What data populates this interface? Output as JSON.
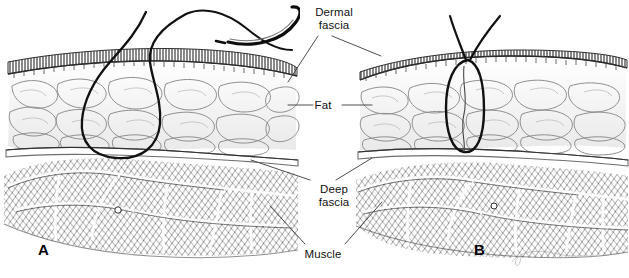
{
  "figure": {
    "type": "medical-illustration",
    "background_color": "#ffffff",
    "ink_color": "#111111",
    "width": 629,
    "height": 278
  },
  "labels": [
    {
      "id": "dermal-fascia",
      "line1": "Dermal",
      "line2": "fascia",
      "x": 303,
      "y": 6
    },
    {
      "id": "fat",
      "line1": "Fat",
      "line2": "",
      "x": 322,
      "y": 100
    },
    {
      "id": "deep-fascia",
      "line1": "Deep",
      "line2": "fascia",
      "x": 303,
      "y": 183
    },
    {
      "id": "muscle",
      "line1": "Muscle",
      "line2": "",
      "x": 302,
      "y": 248
    }
  ],
  "panels": [
    {
      "id": "A",
      "letter": "A",
      "x": 38,
      "y": 243,
      "caption": "Suture loop open, wide bite through fat anchored at deep fascia; curved needle and thread exiting skin"
    },
    {
      "id": "B",
      "letter": "B",
      "x": 474,
      "y": 243,
      "caption": "Suture tightened, narrow closed loop approximating the wound"
    }
  ],
  "tissue_layers": [
    {
      "name": "Dermal fascia",
      "appearance": "thin dark stippled band at skin surface"
    },
    {
      "name": "Fat",
      "appearance": "pale lobular adipose cells"
    },
    {
      "name": "Deep fascia",
      "appearance": "thin white band over muscle"
    },
    {
      "name": "Muscle",
      "appearance": "dense cross-hatched fascicle bundles"
    }
  ],
  "annotations": {
    "signature": "J. Gardner",
    "needle": "curved surgical needle with suture thread"
  }
}
